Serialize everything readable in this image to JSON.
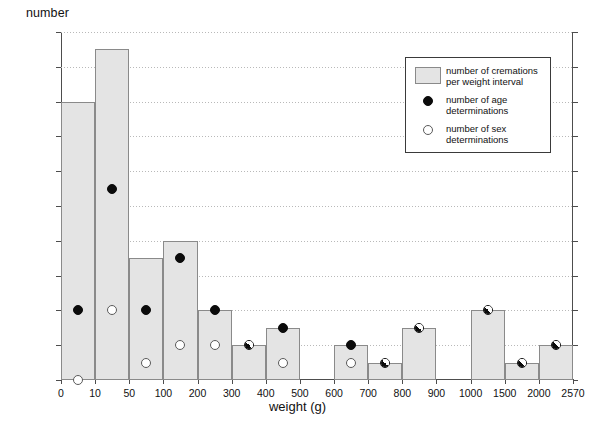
{
  "axes": {
    "y_title": "number",
    "x_title": "weight (g)",
    "y_ticks": [
      0,
      2,
      4,
      6,
      8,
      10,
      12,
      14,
      16,
      18,
      20
    ],
    "x_tick_labels": [
      "0",
      "10",
      "50",
      "100",
      "200",
      "300",
      "400",
      "500",
      "600",
      "700",
      "800",
      "900",
      "1000",
      "1500",
      "2000",
      "2570"
    ]
  },
  "legend": {
    "items": [
      {
        "key": "bar-swatch",
        "line1": "number of cremations",
        "line2": "per weight interval"
      },
      {
        "key": "black-dot",
        "line1": "number of age",
        "line2": "determinations"
      },
      {
        "key": "white-dot",
        "line1": "number of sex",
        "line2": "determinations"
      }
    ]
  },
  "colors": {
    "bar_fill": "#e4e4e4",
    "bar_edge": "#8a8a8a",
    "age_marker": "#0b0b0b",
    "sex_marker": "#ffffff",
    "axis": "#4d4d4d",
    "grid": "#b9b9b9"
  },
  "chart_data": {
    "type": "bar",
    "title": "",
    "xlabel": "weight (g)",
    "ylabel": "number",
    "ylim": [
      0,
      20
    ],
    "ytick_step": 2,
    "grid": true,
    "legend_position": "upper-right",
    "note": "Histogram of cremation counts per weight interval; bins are equal-width on screen but cover unequal weight ranges. Overlaid dots give counts of age determinations (filled black) and sex determinations (open white); half-filled markers indicate an age dot and a sex dot coinciding at the same value.",
    "bin_edges": [
      0,
      10,
      50,
      100,
      200,
      300,
      400,
      500,
      600,
      700,
      800,
      900,
      1000,
      1500,
      2000,
      2570
    ],
    "bin_labels": [
      "0-10",
      "10-50",
      "50-100",
      "100-200",
      "200-300",
      "300-400",
      "400-500",
      "500-600",
      "600-700",
      "700-800",
      "800-900",
      "900-1000",
      "1000-1500",
      "1500-2000",
      "2000-2570"
    ],
    "series": [
      {
        "name": "number of cremations per weight interval",
        "type": "bar",
        "values": [
          16,
          19,
          7,
          8,
          4,
          2,
          3,
          0,
          2,
          1,
          3,
          0,
          4,
          1,
          2
        ]
      },
      {
        "name": "number of age determinations",
        "type": "scatter",
        "marker": "filled-circle",
        "values": [
          4,
          11,
          4,
          7,
          4,
          2,
          3,
          null,
          2,
          1,
          3,
          null,
          4,
          1,
          2
        ]
      },
      {
        "name": "number of sex determinations",
        "type": "scatter",
        "marker": "open-circle",
        "values": [
          0,
          4,
          1,
          2,
          2,
          2,
          1,
          null,
          1,
          1,
          3,
          null,
          4,
          1,
          2
        ]
      }
    ],
    "coincident_markers_bins": [
      "300-400",
      "700-800",
      "800-900",
      "1000-1500",
      "1500-2000",
      "2000-2570"
    ]
  }
}
